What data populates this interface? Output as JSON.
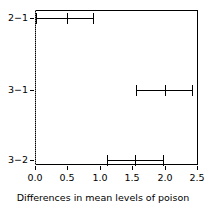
{
  "chart_data": {
    "type": "errorbar",
    "title": "",
    "xlabel": "Differences in mean levels of poison",
    "ylabel": "",
    "xlim": [
      0.0,
      2.5
    ],
    "xticks": [
      "0.0",
      "0.5",
      "1.0",
      "1.5",
      "2.0",
      "2.5"
    ],
    "xtick_values": [
      0.0,
      0.5,
      1.0,
      1.5,
      2.0,
      2.5
    ],
    "categories": [
      "2−1",
      "3−1",
      "3−2"
    ],
    "grid": false,
    "legend": "none",
    "reference_line": {
      "value": 0.0,
      "style": "dotted",
      "color": "#888888"
    },
    "series": [
      {
        "name": "2−1",
        "estimate": 0.49,
        "lower": 0.02,
        "upper": 0.9
      },
      {
        "name": "3−1",
        "estimate": 2.0,
        "lower": 1.56,
        "upper": 2.42
      },
      {
        "name": "3−2",
        "estimate": 1.55,
        "lower": 1.11,
        "upper": 1.97
      }
    ]
  },
  "axes": {
    "x_labels": [
      "0.0",
      "0.5",
      "1.0",
      "1.5",
      "2.0",
      "2.5"
    ],
    "y_labels": [
      "2−1",
      "3−1",
      "3−2"
    ],
    "x_title": "Differences in mean levels of poison"
  },
  "colors": {
    "line": "#000000",
    "frame": "#000000",
    "reference": "#888888",
    "background": "#ffffff"
  }
}
